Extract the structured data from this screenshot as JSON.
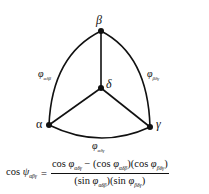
{
  "diagram": {
    "nodes": {
      "beta": {
        "label": "β"
      },
      "delta": {
        "label": "δ"
      },
      "alpha": {
        "label": "α"
      },
      "gamma": {
        "label": "γ"
      }
    },
    "edge_labels": {
      "alpha_beta": {
        "symbol": "φ",
        "subscript": "αδβ"
      },
      "beta_gamma": {
        "symbol": "φ",
        "subscript": "βδγ"
      },
      "alpha_gamma": {
        "symbol": "φ",
        "subscript": "αδγ"
      }
    },
    "colors": {
      "line": "#111111",
      "background": "#ffffff"
    }
  },
  "formula": {
    "lhs_func": "cos ",
    "lhs_symbol": "ψ",
    "lhs_sub": "αβγ",
    "equals": "=",
    "num_part1_func": "cos ",
    "num_part1_symbol": "φ",
    "num_part1_sub": "αδγ",
    "minus": " − ",
    "num_part2_open": "(cos ",
    "num_part2_symbol": "φ",
    "num_part2_sub": "αδβ",
    "num_part2_close": ")",
    "num_part3_open": "(cos ",
    "num_part3_symbol": "φ",
    "num_part3_sub": "βδγ",
    "num_part3_close": ")",
    "den_part1_open": "(sin ",
    "den_part1_symbol": "φ",
    "den_part1_sub": "αδβ",
    "den_part1_close": ")",
    "den_part2_open": "(sin ",
    "den_part2_symbol": "φ",
    "den_part2_sub": "βδγ",
    "den_part2_close": ")"
  }
}
